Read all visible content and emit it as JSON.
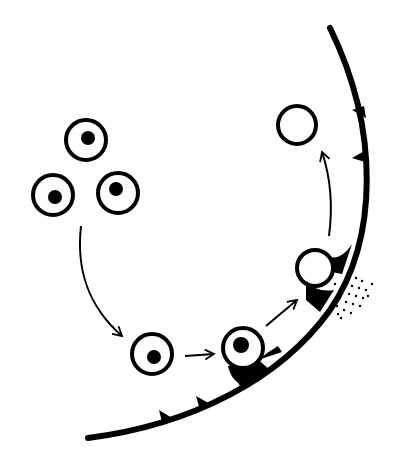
{
  "diagram": {
    "colors": {
      "ink": "#000000",
      "background": "#ffffff"
    },
    "cells_cluster": [
      {
        "id": "cell-top",
        "cx": 86,
        "cy": 140,
        "r": 21,
        "nucleus": {
          "cx": 88,
          "cy": 138,
          "r": 7
        }
      },
      {
        "id": "cell-left",
        "cx": 53,
        "cy": 195,
        "r": 21,
        "nucleus": {
          "cx": 55,
          "cy": 197,
          "r": 7
        }
      },
      {
        "id": "cell-right",
        "cx": 118,
        "cy": 193,
        "r": 21,
        "nucleus": {
          "cx": 116,
          "cy": 190,
          "r": 7
        }
      }
    ],
    "stages": [
      {
        "id": "circulating-cell",
        "cx": 152,
        "cy": 354,
        "r": 21,
        "nucleus": {
          "cx": 154,
          "cy": 357,
          "r": 7
        }
      },
      {
        "id": "adhering-cell",
        "cx": 243,
        "cy": 348,
        "r": 21,
        "nucleus": {
          "cx": 241,
          "cy": 345,
          "r": 8
        }
      },
      {
        "id": "transmigrating-cell",
        "cx": 315,
        "cy": 268,
        "r": 18
      },
      {
        "id": "extravasated-cell",
        "cx": 297,
        "cy": 125,
        "r": 20
      }
    ],
    "vessel_wall": {
      "label": "endothelium",
      "receptors_count": 6
    },
    "arrows_count": 4,
    "dots_label": "secreted enzymes"
  }
}
